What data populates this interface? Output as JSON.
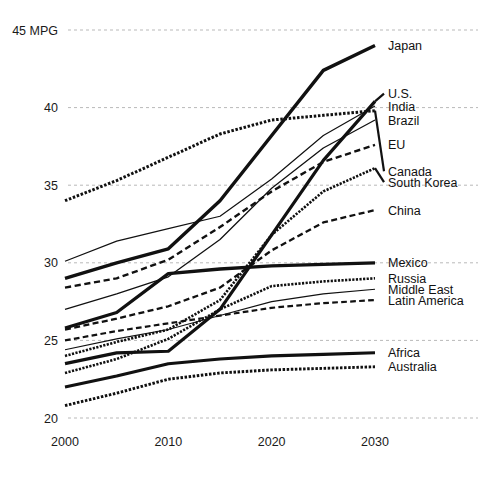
{
  "chart_data": {
    "type": "line",
    "title": "",
    "xlabel": "",
    "ylabel": "MPG",
    "x": [
      2000,
      2005,
      2010,
      2015,
      2020,
      2025,
      2030
    ],
    "xlim": [
      2000,
      2030
    ],
    "ylim": [
      20,
      45
    ],
    "y_ticks": [
      20,
      25,
      30,
      35,
      40,
      45
    ],
    "y_tick_labels": [
      "20",
      "25",
      "30",
      "35",
      "40",
      "45 MPG"
    ],
    "x_ticks": [
      2000,
      2010,
      2020,
      2030
    ],
    "x_tick_labels": [
      "2000",
      "2010",
      "2020",
      "2030"
    ],
    "grid": "horizontal-dotted",
    "legend_position": "right-inline-labels",
    "series": [
      {
        "name": "Japan",
        "label": "Japan",
        "style": "solid",
        "width": 3.4,
        "values": [
          29.0,
          30.0,
          30.9,
          34.0,
          38.2,
          42.4,
          44.0
        ]
      },
      {
        "name": "U.S.",
        "label": "U.S.",
        "style": "solid",
        "width": 3.2,
        "values": [
          23.5,
          24.2,
          24.3,
          27.0,
          31.8,
          36.6,
          40.4
        ]
      },
      {
        "name": "India",
        "label": "India",
        "style": "solid",
        "width": 1.2,
        "values": [
          30.1,
          31.4,
          32.2,
          33.0,
          35.4,
          38.2,
          40.1
        ]
      },
      {
        "name": "Brazil",
        "label": "Brazil",
        "style": "solid",
        "width": 1.3,
        "values": [
          27.0,
          28.0,
          29.1,
          31.5,
          34.8,
          37.4,
          39.2
        ]
      },
      {
        "name": "EU",
        "label": "EU",
        "style": "dashed",
        "width": 2.4,
        "values": [
          28.4,
          29.0,
          30.2,
          32.3,
          34.6,
          36.5,
          37.6
        ]
      },
      {
        "name": "Canada",
        "label": "Canada",
        "style": "dotted",
        "width": 3.0,
        "values": [
          34.0,
          35.3,
          36.8,
          38.3,
          39.2,
          39.5,
          39.8
        ]
      },
      {
        "name": "South Korea",
        "label": "South Korea",
        "style": "dotted",
        "width": 2.6,
        "values": [
          24.0,
          24.9,
          25.7,
          27.6,
          31.8,
          34.6,
          36.1
        ]
      },
      {
        "name": "China",
        "label": "China",
        "style": "dashed",
        "width": 2.3,
        "values": [
          25.7,
          26.4,
          27.2,
          28.4,
          30.8,
          32.6,
          33.4
        ]
      },
      {
        "name": "Mexico",
        "label": "Mexico",
        "style": "solid",
        "width": 3.3,
        "values": [
          25.8,
          26.8,
          29.3,
          29.6,
          29.8,
          29.9,
          30.0
        ]
      },
      {
        "name": "Russia",
        "label": "Russia",
        "style": "dotted",
        "width": 2.6,
        "values": [
          22.9,
          23.8,
          25.1,
          27.0,
          28.5,
          28.8,
          29.0
        ]
      },
      {
        "name": "Middle East",
        "label": "Middle East",
        "style": "solid",
        "width": 1.1,
        "values": [
          24.4,
          25.1,
          25.7,
          26.6,
          27.5,
          28.0,
          28.3
        ]
      },
      {
        "name": "Latin America",
        "label": "Latin America",
        "style": "dashed",
        "width": 2.2,
        "values": [
          25.0,
          25.6,
          26.1,
          26.6,
          27.1,
          27.4,
          27.6
        ]
      },
      {
        "name": "Africa",
        "label": "Africa",
        "style": "solid",
        "width": 3.1,
        "values": [
          22.0,
          22.7,
          23.5,
          23.8,
          24.0,
          24.1,
          24.2
        ]
      },
      {
        "name": "Australia",
        "label": "Australia",
        "style": "dotted",
        "width": 2.9,
        "values": [
          20.8,
          21.6,
          22.5,
          22.9,
          23.1,
          23.2,
          23.3
        ]
      }
    ],
    "right_labels": [
      {
        "label": "Japan",
        "y": 44.0
      },
      {
        "label": "U.S.",
        "y": 40.9
      },
      {
        "label": "India",
        "y": 40.1
      },
      {
        "label": "Brazil",
        "y": 39.2
      },
      {
        "label": "EU",
        "y": 37.6
      },
      {
        "label": "Canada",
        "y": 35.9
      },
      {
        "label": "South Korea",
        "y": 35.2
      },
      {
        "label": "China",
        "y": 33.4
      },
      {
        "label": "Mexico",
        "y": 30.0
      },
      {
        "label": "Russia",
        "y": 29.0
      },
      {
        "label": "Middle East",
        "y": 28.3
      },
      {
        "label": "Latin America",
        "y": 27.6
      },
      {
        "label": "Africa",
        "y": 24.2
      },
      {
        "label": "Australia",
        "y": 23.3
      }
    ]
  }
}
